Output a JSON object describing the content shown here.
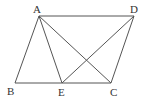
{
  "figure": {
    "stroke_color": "#555555",
    "label_color": "#333333",
    "points": {
      "A": {
        "label": "A",
        "x": 39,
        "y": 16,
        "lx": 33,
        "ly": 13
      },
      "B": {
        "label": "B",
        "x": 15,
        "y": 83,
        "lx": 7,
        "ly": 95
      },
      "C": {
        "label": "C",
        "x": 111,
        "y": 83,
        "lx": 110,
        "ly": 96
      },
      "D": {
        "label": "D",
        "x": 134,
        "y": 16,
        "lx": 130,
        "ly": 13
      },
      "E": {
        "label": "E",
        "x": 62,
        "y": 83,
        "lx": 58,
        "ly": 96
      }
    },
    "segments": [
      [
        "A",
        "D"
      ],
      [
        "A",
        "B"
      ],
      [
        "B",
        "C"
      ],
      [
        "C",
        "D"
      ],
      [
        "A",
        "E"
      ],
      [
        "A",
        "C"
      ],
      [
        "D",
        "E"
      ]
    ]
  }
}
